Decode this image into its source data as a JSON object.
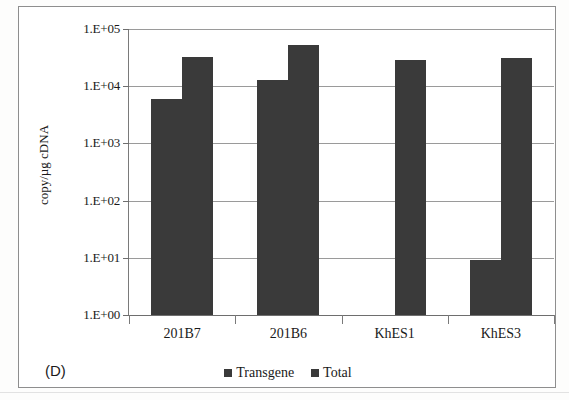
{
  "panel": {
    "label": "(D)"
  },
  "chart_data": {
    "type": "bar",
    "title": "",
    "subtitle": "",
    "xlabel": "",
    "ylabel": "copy/µg cDNA",
    "yscale": "log",
    "ylim": [
      1,
      100000
    ],
    "ytick_labels": [
      "1.E+05",
      "1.E+04",
      "1.E+03",
      "1.E+02",
      "1.E+01",
      "1.E+00"
    ],
    "ytick_values": [
      100000,
      10000,
      1000,
      100,
      10,
      1
    ],
    "grid": true,
    "legend_position": "bottom",
    "categories": [
      "201B7",
      "201B6",
      "KhES1",
      "KhES3"
    ],
    "series": [
      {
        "name": "Transgene",
        "color": "#3a3a3a",
        "values": [
          6000,
          13000,
          null,
          9
        ]
      },
      {
        "name": "Total",
        "color": "#3a3a3a",
        "values": [
          33000,
          52000,
          29000,
          31000
        ]
      }
    ]
  }
}
